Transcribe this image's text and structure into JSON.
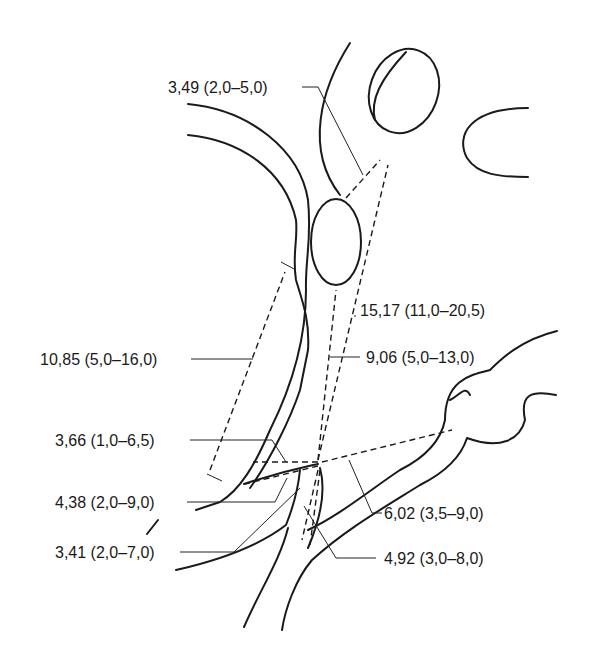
{
  "diagram": {
    "type": "anatomical-measurement-diagram",
    "labels": [
      {
        "id": "m1",
        "text": "3,49 (2,0–5,0)"
      },
      {
        "id": "m2",
        "text": "15,17 (11,0–20,5)"
      },
      {
        "id": "m3",
        "text": "10,85 (5,0–16,0)"
      },
      {
        "id": "m4",
        "text": "9,06 (5,0–13,0)"
      },
      {
        "id": "m5",
        "text": "3,66 (1,0–6,5)"
      },
      {
        "id": "m6",
        "text": "4,38 (2,0–9,0)"
      },
      {
        "id": "m7",
        "text": "6,02 (3,5–9,0)"
      },
      {
        "id": "m8",
        "text": "3,41 (2,0–7,0)"
      },
      {
        "id": "m9",
        "text": "4,92 (3,0–8,0)"
      }
    ],
    "colors": {
      "line": "#1a1a1a",
      "background": "#ffffff"
    }
  }
}
